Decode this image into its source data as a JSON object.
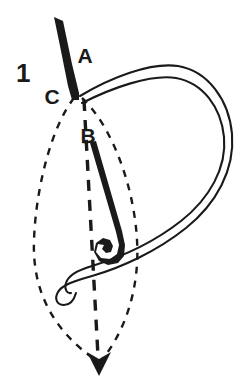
{
  "figure": {
    "number": "1",
    "number_font_size": 26,
    "caption": "",
    "type": "line-art-diagram",
    "background_color": "#ffffff",
    "ink_color": "#1a1a1a"
  },
  "labels": [
    {
      "id": "label-a",
      "text": "A",
      "x": 85,
      "y": 63,
      "font_size": 21,
      "meaning": "needle entry point at top of stitch"
    },
    {
      "id": "label-b",
      "text": "B",
      "x": 88,
      "y": 143,
      "font_size": 21,
      "meaning": "point along the needle shaft / stitch centre"
    },
    {
      "id": "label-c",
      "text": "C",
      "x": 52,
      "y": 104,
      "font_size": 21,
      "meaning": "left-hand anchor point of the stitch"
    }
  ],
  "figure_number_position": {
    "x": 16,
    "y": 82
  },
  "geometry": {
    "needle": {
      "name": "needle",
      "fill": "#1a1a1a",
      "tip_point": {
        "x": 54,
        "y": 17
      },
      "shaft_top": {
        "x": 77,
        "y": 95
      },
      "eye_center": {
        "x": 110,
        "y": 247
      },
      "outline_path": "M 54 17 L 63 21 L 72 64 L 79 93 L 79 100 L 72 100 L 68 86 L 60 46 Z",
      "shaft_path": "M 81 144 L 96 141 L 122 231 L 125 245 L 124 256 L 118 263 L 108 265 L 99 261 L 94 252 L 96 243 L 103 238 L 110 240 L 113 246 L 111 252 L 106 253 L 102 249 L 104 245 L 98 244 L 96 252 L 101 258 L 110 259 L 117 254 L 119 245 L 116 232 L 90 143 Z"
    },
    "thread": {
      "name": "thread",
      "stroke": "#1a1a1a",
      "stroke_width": 2.1,
      "fill": "none",
      "description": "double-outline ribbon forming a large loop to the right, passing through the needle eye and tailing off to the lower left",
      "outer_path": "M 80 96 C 110 78 150 62 178 66 C 208 71 229 100 232 134 C 235 170 216 204 186 228 C 156 252 120 268 92 276 C 74 281 62 285 58 292 C 54 299 57 305 64 305 C 70 305 74 300 76 293",
      "inner_path": "M 82 103 C 112 88 150 74 176 78 C 203 83 221 107 224 137 C 227 168 209 199 181 221 C 153 243 118 258 92 266 C 78 270 68 276 66 283 C 64 289 67 294 71 293"
    },
    "guides": {
      "name": "fabric-guide-lines",
      "stroke": "#1a1a1a",
      "dash_pattern_side": "7 7",
      "dash_pattern_center": "11 9",
      "stroke_width_side": 2.4,
      "stroke_width_center": 3.4,
      "left_curve_path": "M 74 98 C 52 126 36 186 34 240 C 32 290 52 330 98 362",
      "right_curve_path": "M 82 98 C 112 126 134 186 137 240 C 140 290 124 334 100 362",
      "center_line_path": "M 84 100 L 98 356",
      "arrow_tip": {
        "x": 99,
        "y": 372
      },
      "arrow_path": "M 99 376 L 87 352 L 99 359 L 111 352 Z"
    }
  },
  "annotations": {
    "alt_text": "Diagram 1: a threaded needle enters the fabric at point A, the thread loops around to the right, and dashed lines mark a leaf-shaped stitch outline from C through B down to an arrow at the bottom."
  }
}
